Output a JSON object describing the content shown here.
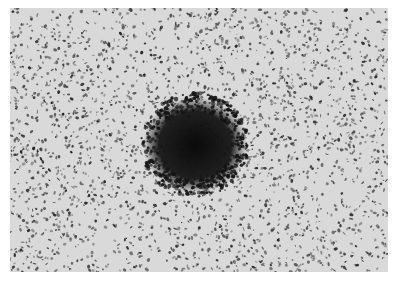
{
  "image": {
    "type": "grayscale-micrograph",
    "description": "Speckled light-gray field with dark granules; a dense dark roughly circular cluster near center",
    "colors": {
      "border": "#ffffff",
      "background": "#d9d9d9",
      "speckle": "#2a2a2a",
      "cluster": "#111111"
    },
    "cluster": {
      "cx": 185,
      "cy": 137,
      "r": 42
    }
  }
}
